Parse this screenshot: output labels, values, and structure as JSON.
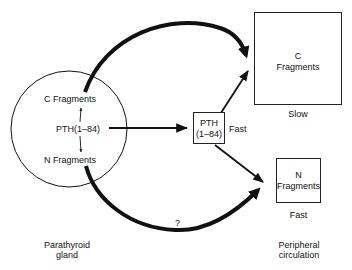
{
  "gland": {
    "c_fragments": "C Fragments",
    "pth": "PTH(1–84)",
    "n_fragments": "N Fragments",
    "caption_line1": "Parathyroid",
    "caption_line2": "gland"
  },
  "intact_box": {
    "line1": "PTH",
    "line2": "(1–84)",
    "rate": "Fast"
  },
  "c_box": {
    "line1": "C",
    "line2": "Fragments",
    "rate": "Slow"
  },
  "n_box": {
    "line1": "N",
    "line2": "Fragments",
    "rate": "Fast"
  },
  "unknown_path_label": "?",
  "circulation": {
    "caption_line1": "Peripheral",
    "caption_line2": "circulation"
  },
  "colors": {
    "stroke": "#111111",
    "background": "#ffffff"
  }
}
